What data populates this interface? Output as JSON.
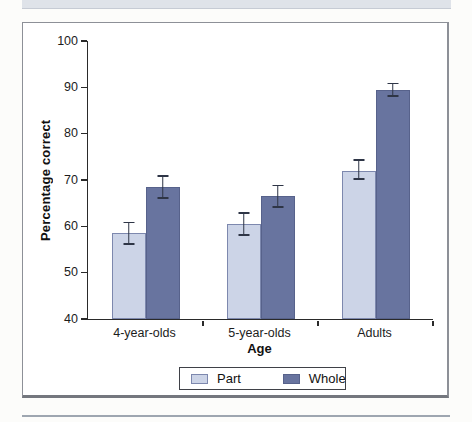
{
  "chart_data": {
    "type": "bar",
    "title": "",
    "xlabel": "Age",
    "ylabel": "Percentage correct",
    "categories": [
      "4-year-olds",
      "5-year-olds",
      "Adults"
    ],
    "series": [
      {
        "name": "Part",
        "color": "#ccd4e7",
        "border_color": "#7d88ae",
        "values": [
          58.5,
          60.5,
          72
        ],
        "error_low": [
          56,
          58,
          70
        ],
        "error_high": [
          61,
          63,
          74.5
        ]
      },
      {
        "name": "Whole",
        "color": "#68749f",
        "border_color": "#57628b",
        "values": [
          68.5,
          66.5,
          89.5
        ],
        "error_low": [
          66,
          64,
          88
        ],
        "error_high": [
          71,
          69,
          91
        ]
      }
    ],
    "ylim": [
      40,
      100
    ],
    "yticks": [
      100,
      90,
      80,
      70,
      60,
      50,
      40
    ],
    "grid": false,
    "legend_position": "bottom",
    "error_bar_color": "#2e3546"
  }
}
